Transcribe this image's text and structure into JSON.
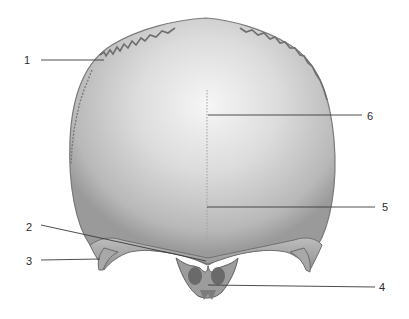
{
  "figure": {
    "background_color": "#ffffff",
    "bone_colors": {
      "light": "#f4f4f4",
      "mid": "#c9c9c9",
      "dark": "#8a8a8a",
      "edge": "#6e6e6e"
    },
    "leader_color": "#3a3a3a",
    "labels": [
      {
        "id": "1",
        "text": "1",
        "side": "left"
      },
      {
        "id": "2",
        "text": "2",
        "side": "left"
      },
      {
        "id": "3",
        "text": "3",
        "side": "left"
      },
      {
        "id": "4",
        "text": "4",
        "side": "right"
      },
      {
        "id": "5",
        "text": "5",
        "side": "right"
      },
      {
        "id": "6",
        "text": "6",
        "side": "right"
      }
    ]
  }
}
